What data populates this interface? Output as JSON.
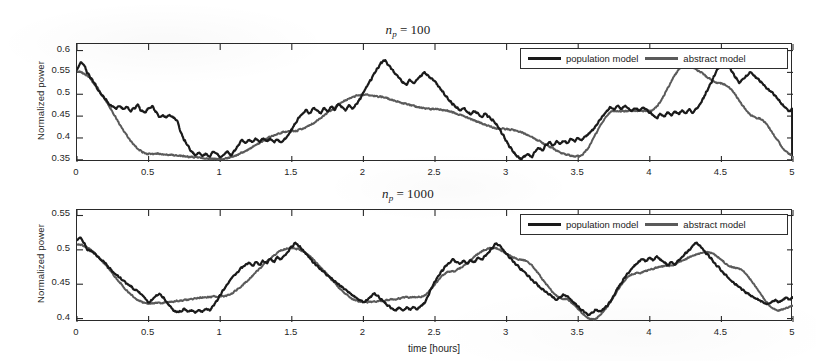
{
  "figure": {
    "background": "#ffffff",
    "series_colors": {
      "population_model": "#1a1a1a",
      "abstract_model": "#5a5a5a"
    }
  },
  "legend": {
    "population_label": "population model",
    "abstract_label": "abstract model"
  },
  "panels": {
    "top": {
      "title_var": "n",
      "title_sub": "p",
      "title_eq": "=",
      "title_num": "100",
      "ylabel": "Normalized power",
      "xlabel": "",
      "yticks": [
        "0.35",
        "0.4",
        "0.45",
        "0.5",
        "0.55",
        "0.6"
      ],
      "xticks": [
        "0",
        "0.5",
        "1",
        "1.5",
        "2",
        "2.5",
        "3",
        "3.5",
        "4",
        "4.5",
        "5"
      ]
    },
    "bottom": {
      "title_var": "n",
      "title_sub": "p",
      "title_eq": "=",
      "title_num": "1000",
      "ylabel": "Normalized power",
      "xlabel": "time [hours]",
      "yticks": [
        "0.4",
        "0.45",
        "0.5",
        "0.55"
      ],
      "xticks": [
        "0",
        "0.5",
        "1",
        "1.5",
        "2",
        "2.5",
        "3",
        "3.5",
        "4",
        "4.5",
        "5"
      ]
    }
  },
  "chart_data": [
    {
      "type": "line",
      "panel": "top",
      "title": "n_p = 100",
      "xlabel": "",
      "ylabel": "Normalized power",
      "xlim": [
        0,
        5
      ],
      "ylim": [
        0.345,
        0.615
      ],
      "xticks": [
        0,
        0.5,
        1,
        1.5,
        2,
        2.5,
        3,
        3.5,
        4,
        4.5,
        5
      ],
      "yticks": [
        0.35,
        0.4,
        0.45,
        0.5,
        0.55,
        0.6
      ],
      "grid": false,
      "legend_position": "top-right",
      "series": [
        {
          "name": "population model",
          "color": "#1a1a1a",
          "x": [
            0,
            0.025,
            0.05,
            0.075,
            0.1,
            0.125,
            0.15,
            0.175,
            0.2,
            0.225,
            0.25,
            0.275,
            0.3,
            0.325,
            0.35,
            0.375,
            0.4,
            0.425,
            0.45,
            0.475,
            0.5,
            0.525,
            0.55,
            0.575,
            0.6,
            0.625,
            0.65,
            0.675,
            0.7,
            0.725,
            0.75,
            0.775,
            0.8,
            0.825,
            0.85,
            0.875,
            0.9,
            0.925,
            0.95,
            0.975,
            1,
            1.025,
            1.05,
            1.075,
            1.1,
            1.125,
            1.15,
            1.175,
            1.2,
            1.225,
            1.25,
            1.275,
            1.3,
            1.325,
            1.35,
            1.375,
            1.4,
            1.425,
            1.45,
            1.475,
            1.5,
            1.525,
            1.55,
            1.575,
            1.6,
            1.625,
            1.65,
            1.675,
            1.7,
            1.725,
            1.75,
            1.775,
            1.8,
            1.825,
            1.85,
            1.875,
            1.9,
            1.925,
            1.95,
            1.975,
            2,
            2.025,
            2.05,
            2.075,
            2.1,
            2.125,
            2.15,
            2.175,
            2.2,
            2.225,
            2.25,
            2.275,
            2.3,
            2.325,
            2.35,
            2.375,
            2.4,
            2.425,
            2.45,
            2.475,
            2.5,
            2.525,
            2.55,
            2.575,
            2.6,
            2.625,
            2.65,
            2.675,
            2.7,
            2.725,
            2.75,
            2.775,
            2.8,
            2.825,
            2.85,
            2.875,
            2.9,
            2.925,
            2.95,
            2.975,
            3,
            3.025,
            3.05,
            3.075,
            3.1,
            3.125,
            3.15,
            3.175,
            3.2,
            3.225,
            3.25,
            3.275,
            3.3,
            3.325,
            3.35,
            3.375,
            3.4,
            3.425,
            3.45,
            3.475,
            3.5,
            3.525,
            3.55,
            3.575,
            3.6,
            3.625,
            3.65,
            3.675,
            3.7,
            3.725,
            3.75,
            3.775,
            3.8,
            3.825,
            3.85,
            3.875,
            3.9,
            3.925,
            3.95,
            3.975,
            4,
            4.025,
            4.05,
            4.075,
            4.1,
            4.125,
            4.15,
            4.175,
            4.2,
            4.225,
            4.25,
            4.275,
            4.3,
            4.325,
            4.35,
            4.375,
            4.4,
            4.425,
            4.45,
            4.475,
            4.5,
            4.525,
            4.55,
            4.575,
            4.6,
            4.625,
            4.65,
            4.675,
            4.7,
            4.725,
            4.75,
            4.775,
            4.8,
            4.825,
            4.85,
            4.875,
            4.9,
            4.925,
            4.95,
            4.975,
            5
          ],
          "y": [
            0.556,
            0.572,
            0.566,
            0.548,
            0.536,
            0.524,
            0.508,
            0.498,
            0.489,
            0.478,
            0.472,
            0.468,
            0.473,
            0.466,
            0.471,
            0.462,
            0.468,
            0.475,
            0.462,
            0.459,
            0.468,
            0.472,
            0.46,
            0.449,
            0.452,
            0.447,
            0.452,
            0.446,
            0.44,
            0.412,
            0.395,
            0.382,
            0.369,
            0.361,
            0.366,
            0.359,
            0.364,
            0.358,
            0.368,
            0.363,
            0.356,
            0.362,
            0.369,
            0.361,
            0.371,
            0.382,
            0.396,
            0.389,
            0.396,
            0.39,
            0.398,
            0.391,
            0.399,
            0.393,
            0.398,
            0.391,
            0.396,
            0.39,
            0.397,
            0.406,
            0.42,
            0.433,
            0.448,
            0.455,
            0.463,
            0.456,
            0.47,
            0.464,
            0.456,
            0.468,
            0.461,
            0.473,
            0.465,
            0.478,
            0.47,
            0.463,
            0.474,
            0.468,
            0.476,
            0.489,
            0.503,
            0.518,
            0.532,
            0.548,
            0.561,
            0.572,
            0.578,
            0.566,
            0.556,
            0.545,
            0.537,
            0.528,
            0.522,
            0.532,
            0.526,
            0.534,
            0.542,
            0.55,
            0.543,
            0.536,
            0.528,
            0.519,
            0.508,
            0.496,
            0.486,
            0.477,
            0.47,
            0.463,
            0.468,
            0.461,
            0.455,
            0.462,
            0.456,
            0.449,
            0.456,
            0.448,
            0.441,
            0.432,
            0.42,
            0.406,
            0.392,
            0.378,
            0.366,
            0.357,
            0.352,
            0.358,
            0.363,
            0.356,
            0.369,
            0.378,
            0.372,
            0.384,
            0.39,
            0.383,
            0.392,
            0.387,
            0.394,
            0.388,
            0.398,
            0.392,
            0.4,
            0.396,
            0.404,
            0.41,
            0.418,
            0.428,
            0.44,
            0.452,
            0.462,
            0.47,
            0.465,
            0.473,
            0.466,
            0.474,
            0.468,
            0.462,
            0.469,
            0.463,
            0.47,
            0.464,
            0.458,
            0.452,
            0.446,
            0.455,
            0.449,
            0.458,
            0.452,
            0.46,
            0.455,
            0.462,
            0.456,
            0.465,
            0.459,
            0.468,
            0.476,
            0.492,
            0.508,
            0.524,
            0.542,
            0.558,
            0.57,
            0.577,
            0.566,
            0.552,
            0.538,
            0.526,
            0.534,
            0.542,
            0.55,
            0.544,
            0.536,
            0.528,
            0.52,
            0.512,
            0.504,
            0.496,
            0.486,
            0.476,
            0.47,
            0.462,
            0.468,
            0.461,
            0.453,
            0.448,
            0.44,
            0.432,
            0.42,
            0.406,
            0.392,
            0.376,
            0.364,
            0.356,
            0.361,
            0.355,
            0.362,
            0.358,
            0.365,
            0.36,
            0.366,
            0.359,
            0.365,
            0.357,
            0.363
          ]
        },
        {
          "name": "abstract model",
          "color": "#5a5a5a",
          "note": "Tracks population model closely; small negative offset growing after x≈3.7",
          "x": [
            0,
            0.5,
            1,
            1.5,
            2,
            2.5,
            3,
            3.5,
            3.75,
            4,
            4.25,
            4.5,
            4.75,
            5
          ],
          "y": [
            0.552,
            0.364,
            0.352,
            0.416,
            0.499,
            0.466,
            0.42,
            0.358,
            0.462,
            0.462,
            0.566,
            0.525,
            0.446,
            0.36
          ]
        }
      ]
    },
    {
      "type": "line",
      "panel": "bottom",
      "title": "n_p = 1000",
      "xlabel": "time [hours]",
      "ylabel": "Normalized power",
      "xlim": [
        0,
        5
      ],
      "ylim": [
        0.395,
        0.558
      ],
      "xticks": [
        0,
        0.5,
        1,
        1.5,
        2,
        2.5,
        3,
        3.5,
        4,
        4.5,
        5
      ],
      "yticks": [
        0.4,
        0.45,
        0.5,
        0.55
      ],
      "grid": false,
      "legend_position": "top-right",
      "series": [
        {
          "name": "population model",
          "color": "#1a1a1a",
          "x": [
            0,
            0.025,
            0.05,
            0.075,
            0.1,
            0.125,
            0.15,
            0.175,
            0.2,
            0.225,
            0.25,
            0.275,
            0.3,
            0.325,
            0.35,
            0.375,
            0.4,
            0.425,
            0.45,
            0.475,
            0.5,
            0.525,
            0.55,
            0.575,
            0.6,
            0.625,
            0.65,
            0.675,
            0.7,
            0.725,
            0.75,
            0.775,
            0.8,
            0.825,
            0.85,
            0.875,
            0.9,
            0.925,
            0.95,
            0.975,
            1,
            1.025,
            1.05,
            1.075,
            1.1,
            1.125,
            1.15,
            1.175,
            1.2,
            1.225,
            1.25,
            1.275,
            1.3,
            1.325,
            1.35,
            1.375,
            1.4,
            1.425,
            1.45,
            1.475,
            1.5,
            1.525,
            1.55,
            1.575,
            1.6,
            1.625,
            1.65,
            1.675,
            1.7,
            1.725,
            1.75,
            1.775,
            1.8,
            1.825,
            1.85,
            1.875,
            1.9,
            1.925,
            1.95,
            1.975,
            2,
            2.025,
            2.05,
            2.075,
            2.1,
            2.125,
            2.15,
            2.175,
            2.2,
            2.225,
            2.25,
            2.275,
            2.3,
            2.325,
            2.35,
            2.375,
            2.4,
            2.425,
            2.45,
            2.475,
            2.5,
            2.525,
            2.55,
            2.575,
            2.6,
            2.625,
            2.65,
            2.675,
            2.7,
            2.725,
            2.75,
            2.775,
            2.8,
            2.825,
            2.85,
            2.875,
            2.9,
            2.925,
            2.95,
            2.975,
            3,
            3.025,
            3.05,
            3.075,
            3.1,
            3.125,
            3.15,
            3.175,
            3.2,
            3.225,
            3.25,
            3.275,
            3.3,
            3.325,
            3.35,
            3.375,
            3.4,
            3.425,
            3.45,
            3.475,
            3.5,
            3.525,
            3.55,
            3.575,
            3.6,
            3.625,
            3.65,
            3.675,
            3.7,
            3.725,
            3.75,
            3.775,
            3.8,
            3.825,
            3.85,
            3.875,
            3.9,
            3.925,
            3.95,
            3.975,
            4,
            4.025,
            4.05,
            4.075,
            4.1,
            4.125,
            4.15,
            4.175,
            4.2,
            4.225,
            4.25,
            4.275,
            4.3,
            4.325,
            4.35,
            4.375,
            4.4,
            4.425,
            4.45,
            4.475,
            4.5,
            4.525,
            4.55,
            4.575,
            4.6,
            4.625,
            4.65,
            4.675,
            4.7,
            4.725,
            4.75,
            4.775,
            4.8,
            4.825,
            4.85,
            4.875,
            4.9,
            4.925,
            4.95,
            4.975,
            5
          ],
          "y": [
            0.514,
            0.518,
            0.509,
            0.5,
            0.498,
            0.494,
            0.489,
            0.485,
            0.48,
            0.474,
            0.468,
            0.464,
            0.459,
            0.455,
            0.45,
            0.447,
            0.443,
            0.44,
            0.435,
            0.429,
            0.424,
            0.427,
            0.433,
            0.436,
            0.431,
            0.424,
            0.418,
            0.412,
            0.409,
            0.411,
            0.414,
            0.41,
            0.412,
            0.409,
            0.413,
            0.41,
            0.414,
            0.412,
            0.418,
            0.425,
            0.434,
            0.442,
            0.45,
            0.457,
            0.463,
            0.468,
            0.474,
            0.478,
            0.481,
            0.477,
            0.482,
            0.478,
            0.484,
            0.481,
            0.487,
            0.483,
            0.489,
            0.486,
            0.492,
            0.498,
            0.504,
            0.51,
            0.506,
            0.5,
            0.494,
            0.488,
            0.482,
            0.477,
            0.472,
            0.468,
            0.463,
            0.459,
            0.454,
            0.45,
            0.446,
            0.442,
            0.438,
            0.434,
            0.43,
            0.427,
            0.424,
            0.427,
            0.432,
            0.436,
            0.433,
            0.428,
            0.423,
            0.418,
            0.414,
            0.412,
            0.415,
            0.412,
            0.416,
            0.413,
            0.417,
            0.414,
            0.418,
            0.422,
            0.433,
            0.444,
            0.455,
            0.463,
            0.47,
            0.476,
            0.481,
            0.486,
            0.482,
            0.479,
            0.484,
            0.48,
            0.485,
            0.482,
            0.488,
            0.485,
            0.491,
            0.497,
            0.503,
            0.509,
            0.506,
            0.5,
            0.494,
            0.488,
            0.482,
            0.477,
            0.472,
            0.467,
            0.462,
            0.457,
            0.452,
            0.447,
            0.443,
            0.439,
            0.435,
            0.431,
            0.428,
            0.431,
            0.435,
            0.432,
            0.427,
            0.422,
            0.417,
            0.412,
            0.408,
            0.405,
            0.409,
            0.413,
            0.41,
            0.414,
            0.418,
            0.425,
            0.434,
            0.444,
            0.452,
            0.46,
            0.467,
            0.473,
            0.478,
            0.483,
            0.487,
            0.484,
            0.489,
            0.485,
            0.49,
            0.486,
            0.482,
            0.478,
            0.482,
            0.479,
            0.484,
            0.489,
            0.495,
            0.5,
            0.506,
            0.51,
            0.506,
            0.5,
            0.494,
            0.488,
            0.482,
            0.476,
            0.47,
            0.464,
            0.459,
            0.454,
            0.45,
            0.446,
            0.442,
            0.438,
            0.434,
            0.431,
            0.428,
            0.425,
            0.423,
            0.421,
            0.424,
            0.427,
            0.424,
            0.427,
            0.43,
            0.428,
            0.431
          ]
        },
        {
          "name": "abstract model",
          "color": "#5a5a5a",
          "note": "Matches closely for x<2.4, then runs consistently below the population model; gap widens to about 0.012 near x=4.4",
          "x": [
            0,
            0.5,
            1,
            1.5,
            2,
            2.4,
            2.6,
            2.9,
            3.1,
            3.4,
            3.6,
            3.9,
            4.1,
            4.4,
            4.6,
            4.9,
            5
          ],
          "y": [
            0.508,
            0.422,
            0.432,
            0.503,
            0.424,
            0.432,
            0.468,
            0.503,
            0.486,
            0.429,
            0.399,
            0.466,
            0.476,
            0.497,
            0.474,
            0.412,
            0.418
          ]
        }
      ]
    }
  ]
}
